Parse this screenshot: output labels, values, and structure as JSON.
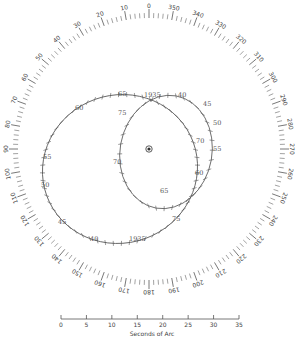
{
  "diagram": {
    "center": [
      149,
      149
    ],
    "position_angle_dial": {
      "radius": 140,
      "major_labels": [
        "0",
        "10",
        "20",
        "30",
        "40",
        "50",
        "60",
        "70",
        "80",
        "90",
        "100",
        "110",
        "120",
        "130",
        "140",
        "150",
        "160",
        "170",
        "180",
        "190",
        "200",
        "210",
        "220",
        "230",
        "240",
        "250",
        "260",
        "270",
        "280",
        "290",
        "300",
        "310",
        "320",
        "330",
        "340",
        "350"
      ],
      "label_step_deg": 10,
      "minor_tick_step_deg": 2
    },
    "primary_star_marker": "circled-dot",
    "orbits": [
      {
        "name": "outer-orbit",
        "labels": [
          {
            "text": "1935",
            "x": 144,
            "y": 97
          },
          {
            "text": "40",
            "x": 178,
            "y": 97
          },
          {
            "text": "45",
            "x": 203,
            "y": 106
          },
          {
            "text": "50",
            "x": 213,
            "y": 125
          },
          {
            "text": "55",
            "x": 213,
            "y": 151
          },
          {
            "text": "60",
            "x": 195,
            "y": 175
          },
          {
            "text": "65",
            "x": 118,
            "y": 96
          },
          {
            "text": "60",
            "x": 75,
            "y": 110
          },
          {
            "text": "55",
            "x": 43,
            "y": 159
          },
          {
            "text": "50",
            "x": 41,
            "y": 187
          },
          {
            "text": "45",
            "x": 58,
            "y": 224
          },
          {
            "text": "40",
            "x": 90,
            "y": 241
          },
          {
            "text": "1935",
            "x": 129,
            "y": 241
          }
        ]
      },
      {
        "name": "inner-orbit",
        "labels": [
          {
            "text": "75",
            "x": 118,
            "y": 115
          },
          {
            "text": "70",
            "x": 196,
            "y": 143
          },
          {
            "text": "70",
            "x": 113,
            "y": 164
          },
          {
            "text": "65",
            "x": 160,
            "y": 193
          },
          {
            "text": "75",
            "x": 172,
            "y": 221
          }
        ]
      }
    ],
    "scale_bar": {
      "ticks": [
        "0",
        "5",
        "10",
        "15",
        "20",
        "25",
        "30",
        "35"
      ],
      "caption": "Seconds of Arc"
    }
  }
}
